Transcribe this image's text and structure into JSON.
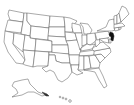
{
  "map": {
    "type": "choropleth",
    "region": "United States",
    "highlighted_states": [
      "New Jersey"
    ],
    "highlight_color": "#111111",
    "base_fill": "#ffffff",
    "border_color": "#555555",
    "insets": [
      "Alaska",
      "Hawaii"
    ]
  }
}
